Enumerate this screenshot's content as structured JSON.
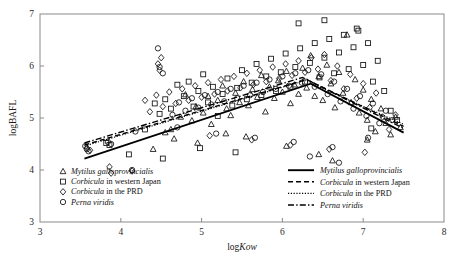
{
  "chart_data": {
    "type": "scatter",
    "title": "",
    "xlabel": "logKow",
    "ylabel": "logBAFL",
    "xlim": [
      3,
      8
    ],
    "ylim": [
      3,
      7
    ],
    "xticks": [
      3,
      4,
      5,
      6,
      7,
      8
    ],
    "yticks": [
      3,
      4,
      5,
      6,
      7
    ],
    "grid": false,
    "marker_legend_position": "bottom-left-inside",
    "line_legend_position": "bottom-right-inside",
    "series": [
      {
        "name": "Mytilus galloprovincialis",
        "name_italic_part": "Mytilus galloprovincialis",
        "marker": "triangle",
        "line_style": "solid",
        "points": [
          [
            4.55,
            4.72
          ],
          [
            4.62,
            4.78
          ],
          [
            4.66,
            4.6
          ],
          [
            4.74,
            5.02
          ],
          [
            4.8,
            5.45
          ],
          [
            4.88,
            4.95
          ],
          [
            4.93,
            5.22
          ],
          [
            5.02,
            5.1
          ],
          [
            5.08,
            5.42
          ],
          [
            5.12,
            4.88
          ],
          [
            5.2,
            5.34
          ],
          [
            5.26,
            5.62
          ],
          [
            5.31,
            5.18
          ],
          [
            5.36,
            5.05
          ],
          [
            5.42,
            5.48
          ],
          [
            5.47,
            5.3
          ],
          [
            5.52,
            5.7
          ],
          [
            5.58,
            5.24
          ],
          [
            5.63,
            5.55
          ],
          [
            5.69,
            5.4
          ],
          [
            5.74,
            5.82
          ],
          [
            5.79,
            5.12
          ],
          [
            5.84,
            5.6
          ],
          [
            5.9,
            5.38
          ],
          [
            5.95,
            5.72
          ],
          [
            6.0,
            5.5
          ],
          [
            6.05,
            5.9
          ],
          [
            6.1,
            5.28
          ],
          [
            6.15,
            5.64
          ],
          [
            6.2,
            5.46
          ],
          [
            6.25,
            5.96
          ],
          [
            6.3,
            5.58
          ],
          [
            6.35,
            6.2
          ],
          [
            6.4,
            5.42
          ],
          [
            6.45,
            5.8
          ],
          [
            6.5,
            5.34
          ],
          [
            6.55,
            6.02
          ],
          [
            6.6,
            5.66
          ],
          [
            6.65,
            5.2
          ],
          [
            6.7,
            5.88
          ],
          [
            6.75,
            5.48
          ],
          [
            6.8,
            6.6
          ],
          [
            6.85,
            5.3
          ],
          [
            6.9,
            5.74
          ],
          [
            6.95,
            5.1
          ],
          [
            7.0,
            5.54
          ],
          [
            7.05,
            4.96
          ],
          [
            7.1,
            5.36
          ],
          [
            7.15,
            4.74
          ],
          [
            7.22,
            5.18
          ],
          [
            7.28,
            4.9
          ],
          [
            7.34,
            4.68
          ],
          [
            7.4,
            5.02
          ],
          [
            7.46,
            4.82
          ],
          [
            4.4,
            4.4
          ],
          [
            4.95,
            4.52
          ],
          [
            5.55,
            4.64
          ],
          [
            6.05,
            4.46
          ],
          [
            6.45,
            4.3
          ],
          [
            6.62,
            4.18
          ],
          [
            7.05,
            4.58
          ],
          [
            5.3,
            4.7
          ]
        ],
        "fit_vertices": [
          [
            3.55,
            4.22
          ],
          [
            6.35,
            5.66
          ],
          [
            7.5,
            4.72
          ]
        ]
      },
      {
        "name": "Corbicula in western Japan",
        "name_italic_part": "Corbicula",
        "marker": "square",
        "line_style": "dashed",
        "points": [
          [
            3.82,
            4.52
          ],
          [
            3.86,
            4.48
          ],
          [
            4.3,
            4.78
          ],
          [
            4.42,
            5.28
          ],
          [
            4.48,
            5.08
          ],
          [
            4.55,
            5.36
          ],
          [
            4.62,
            5.18
          ],
          [
            4.7,
            5.64
          ],
          [
            4.78,
            5.42
          ],
          [
            4.84,
            5.7
          ],
          [
            4.9,
            5.22
          ],
          [
            4.96,
            5.52
          ],
          [
            5.02,
            5.84
          ],
          [
            5.08,
            5.3
          ],
          [
            5.14,
            5.6
          ],
          [
            5.2,
            5.04
          ],
          [
            5.26,
            5.46
          ],
          [
            5.32,
            5.76
          ],
          [
            5.38,
            5.24
          ],
          [
            5.44,
            5.58
          ],
          [
            5.5,
            5.92
          ],
          [
            5.56,
            5.36
          ],
          [
            5.62,
            5.68
          ],
          [
            5.68,
            6.04
          ],
          [
            5.74,
            5.44
          ],
          [
            5.8,
            5.8
          ],
          [
            5.86,
            6.14
          ],
          [
            5.92,
            5.52
          ],
          [
            5.98,
            5.88
          ],
          [
            6.04,
            6.24
          ],
          [
            6.1,
            5.6
          ],
          [
            6.16,
            5.98
          ],
          [
            6.22,
            6.34
          ],
          [
            6.28,
            5.7
          ],
          [
            6.34,
            6.06
          ],
          [
            6.4,
            6.44
          ],
          [
            6.46,
            5.78
          ],
          [
            6.52,
            6.16
          ],
          [
            6.58,
            6.52
          ],
          [
            6.64,
            5.86
          ],
          [
            6.7,
            6.26
          ],
          [
            6.76,
            6.6
          ],
          [
            6.82,
            5.94
          ],
          [
            6.88,
            6.36
          ],
          [
            6.94,
            6.68
          ],
          [
            7.0,
            6.02
          ],
          [
            7.06,
            6.44
          ],
          [
            7.12,
            5.7
          ],
          [
            7.18,
            6.1
          ],
          [
            7.26,
            5.52
          ],
          [
            7.34,
            5.14
          ],
          [
            7.42,
            4.96
          ],
          [
            4.1,
            4.3
          ],
          [
            4.52,
            4.22
          ],
          [
            4.98,
            4.42
          ],
          [
            5.42,
            4.34
          ],
          [
            6.2,
            6.82
          ],
          [
            6.52,
            6.88
          ],
          [
            6.92,
            6.72
          ],
          [
            7.1,
            4.8
          ]
        ],
        "fit_vertices": [
          [
            3.55,
            4.48
          ],
          [
            6.3,
            5.74
          ],
          [
            7.5,
            4.84
          ]
        ]
      },
      {
        "name": "Corbicula in the PRD",
        "name_italic_part": "Corbicula",
        "marker": "diamond",
        "line_style": "dotted",
        "points": [
          [
            3.58,
            4.42
          ],
          [
            3.62,
            4.38
          ],
          [
            3.86,
            4.06
          ],
          [
            3.88,
            3.94
          ],
          [
            4.14,
            3.98
          ],
          [
            4.3,
            5.34
          ],
          [
            4.36,
            5.12
          ],
          [
            4.44,
            5.44
          ],
          [
            4.52,
            5.22
          ],
          [
            4.6,
            5.5
          ],
          [
            4.68,
            5.28
          ],
          [
            4.76,
            5.56
          ],
          [
            4.84,
            5.34
          ],
          [
            4.92,
            5.62
          ],
          [
            5.0,
            5.4
          ],
          [
            5.08,
            5.68
          ],
          [
            5.16,
            5.46
          ],
          [
            5.24,
            5.74
          ],
          [
            5.32,
            5.52
          ],
          [
            5.4,
            5.8
          ],
          [
            5.48,
            5.58
          ],
          [
            5.56,
            5.86
          ],
          [
            5.64,
            5.64
          ],
          [
            5.72,
            5.92
          ],
          [
            5.8,
            5.7
          ],
          [
            5.88,
            5.98
          ],
          [
            5.96,
            5.76
          ],
          [
            6.04,
            6.04
          ],
          [
            6.12,
            5.82
          ],
          [
            6.2,
            6.1
          ],
          [
            6.28,
            5.88
          ],
          [
            6.36,
            6.16
          ],
          [
            6.44,
            5.94
          ],
          [
            6.52,
            6.22
          ],
          [
            6.6,
            5.72
          ],
          [
            6.68,
            6.0
          ],
          [
            6.76,
            5.56
          ],
          [
            6.84,
            5.84
          ],
          [
            6.92,
            5.38
          ],
          [
            7.0,
            5.66
          ],
          [
            7.08,
            5.2
          ],
          [
            7.16,
            5.48
          ],
          [
            7.24,
            5.02
          ],
          [
            7.32,
            4.78
          ],
          [
            7.4,
            5.06
          ],
          [
            4.46,
            6.04
          ],
          [
            4.48,
            5.92
          ],
          [
            4.5,
            6.16
          ],
          [
            5.1,
            4.66
          ],
          [
            5.62,
            4.58
          ],
          [
            6.1,
            4.48
          ],
          [
            6.58,
            4.4
          ],
          [
            7.02,
            4.34
          ]
        ],
        "fit_vertices": [
          [
            3.55,
            4.46
          ],
          [
            6.28,
            5.72
          ],
          [
            7.5,
            4.88
          ]
        ]
      },
      {
        "name": "Perna viridis",
        "name_italic_part": "Perna viridis",
        "marker": "circle",
        "line_style": "dashdot",
        "points": [
          [
            3.56,
            4.46
          ],
          [
            3.58,
            4.4
          ],
          [
            3.6,
            4.36
          ],
          [
            3.84,
            4.54
          ],
          [
            3.88,
            4.5
          ],
          [
            4.14,
            4.0
          ],
          [
            4.46,
            6.34
          ],
          [
            4.48,
            5.98
          ],
          [
            4.52,
            5.86
          ],
          [
            4.64,
            5.06
          ],
          [
            4.72,
            5.3
          ],
          [
            4.8,
            5.14
          ],
          [
            4.88,
            5.38
          ],
          [
            4.96,
            5.2
          ],
          [
            5.04,
            5.44
          ],
          [
            5.12,
            5.26
          ],
          [
            5.2,
            5.5
          ],
          [
            5.28,
            5.32
          ],
          [
            5.36,
            5.56
          ],
          [
            5.44,
            5.38
          ],
          [
            5.52,
            5.62
          ],
          [
            5.6,
            5.44
          ],
          [
            5.68,
            5.68
          ],
          [
            5.76,
            5.5
          ],
          [
            5.84,
            5.74
          ],
          [
            5.92,
            5.56
          ],
          [
            6.0,
            5.8
          ],
          [
            6.08,
            5.62
          ],
          [
            6.16,
            5.86
          ],
          [
            6.24,
            5.68
          ],
          [
            6.32,
            5.92
          ],
          [
            6.4,
            5.6
          ],
          [
            6.48,
            5.84
          ],
          [
            6.56,
            5.46
          ],
          [
            6.64,
            5.7
          ],
          [
            6.72,
            5.32
          ],
          [
            6.8,
            5.56
          ],
          [
            6.88,
            5.18
          ],
          [
            6.96,
            5.42
          ],
          [
            7.04,
            5.04
          ],
          [
            7.12,
            5.28
          ],
          [
            7.2,
            4.9
          ],
          [
            7.28,
            5.14
          ],
          [
            7.36,
            4.96
          ],
          [
            4.18,
            4.74
          ],
          [
            4.7,
            4.82
          ],
          [
            5.18,
            4.7
          ],
          [
            5.66,
            4.62
          ],
          [
            6.14,
            4.54
          ],
          [
            6.62,
            4.44
          ],
          [
            7.06,
            4.62
          ],
          [
            6.34,
            4.26
          ],
          [
            6.7,
            4.14
          ]
        ],
        "fit_vertices": [
          [
            3.55,
            4.52
          ],
          [
            6.25,
            5.78
          ],
          [
            7.5,
            4.8
          ]
        ]
      }
    ]
  },
  "marker_legend": {
    "items": [
      {
        "marker": "triangle",
        "text": "Mytilus galloprovincialis",
        "italic_prefix": "Mytilus galloprovincialis",
        "plain_suffix": ""
      },
      {
        "marker": "square",
        "text": "Corbicula in western Japan",
        "italic_prefix": "Corbicula",
        "plain_suffix": " in western Japan"
      },
      {
        "marker": "diamond",
        "text": "Corbicula in the PRD",
        "italic_prefix": "Corbicula",
        "plain_suffix": " in the PRD"
      },
      {
        "marker": "circle",
        "text": "Perna viridis",
        "italic_prefix": "Perna viridis",
        "plain_suffix": ""
      }
    ]
  },
  "line_legend": {
    "items": [
      {
        "line_style": "solid",
        "text": "Mytilus galloprovincialis",
        "italic_prefix": "Mytilus galloprovincialis",
        "plain_suffix": ""
      },
      {
        "line_style": "dashed",
        "text": "Corbicula in western Japan",
        "italic_prefix": "Corbicula",
        "plain_suffix": " in western Japan"
      },
      {
        "line_style": "dotted",
        "text": "Corbicula in the PRD",
        "italic_prefix": "Corbicula",
        "plain_suffix": " in the PRD"
      },
      {
        "line_style": "dashdot",
        "text": "Perna viridis",
        "italic_prefix": "Perna viridis",
        "plain_suffix": ""
      }
    ]
  },
  "axes": {
    "x_title_plain": "log",
    "x_title_italic": "Kow",
    "y_title": "logBAFL",
    "x_tick_labels": [
      "3",
      "4",
      "5",
      "6",
      "7",
      "8"
    ],
    "y_tick_labels": [
      "3",
      "4",
      "5",
      "6",
      "7"
    ]
  },
  "colors": {
    "axis": "#8a8a8a",
    "marker": "#111111",
    "line": "#000000",
    "text": "#1a1a1a",
    "background": "#ffffff"
  }
}
